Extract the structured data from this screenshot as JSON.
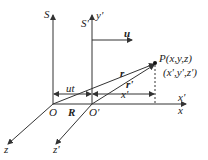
{
  "diagram": {
    "frames": {
      "S": {
        "label": "S",
        "origin_label": "O",
        "x_label": "x",
        "z_label": "z"
      },
      "S_prime": {
        "label": "S'",
        "origin_label": "O'",
        "y_label": "y'",
        "x_label": "x'",
        "z_label": "z'"
      }
    },
    "velocity": {
      "label": "u"
    },
    "point": {
      "label": "P(x,y,z)",
      "prime_coords": "(x',y',z')"
    },
    "vectors": {
      "r": "r",
      "r_prime": "r'",
      "R": "R"
    },
    "dimensions": {
      "ut": "ut",
      "x_prime": "x'"
    },
    "colors": {
      "line": "#333333",
      "text": "#222222",
      "background": "#ffffff"
    }
  }
}
